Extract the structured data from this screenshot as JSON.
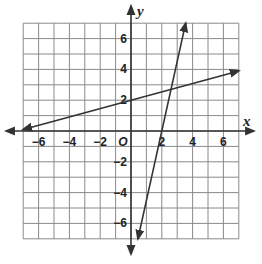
{
  "chart_data": {
    "type": "line",
    "title": "",
    "xlabel": "x",
    "ylabel": "y",
    "xlim": [
      -7,
      7
    ],
    "ylim": [
      -7,
      7
    ],
    "grid": true,
    "origin_label": "O",
    "x_ticks": [
      "-6",
      "-4",
      "-2",
      "2",
      "4",
      "6"
    ],
    "y_ticks": [
      "6",
      "4",
      "2",
      "-2",
      "-4",
      "-6"
    ],
    "series": [
      {
        "name": "line-1",
        "description": "shallow line",
        "points": [
          [
            -7,
            0.1
          ],
          [
            0,
            2
          ],
          [
            7,
            3.9
          ]
        ],
        "slope": 0.27,
        "y_intercept": 2
      },
      {
        "name": "line-2",
        "description": "steep line",
        "points": [
          [
            0.45,
            -7
          ],
          [
            2,
            0
          ],
          [
            3.55,
            7
          ]
        ],
        "slope": 4.5,
        "y_intercept": -9
      }
    ],
    "colors": {
      "grid": "#8a8a8a",
      "axis": "#333333",
      "line": "#333333"
    }
  }
}
